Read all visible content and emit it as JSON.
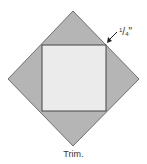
{
  "diagram": {
    "caption": "Trim.",
    "measurement_label": {
      "numerator": "1",
      "denominator": "4",
      "unit_mark": "\""
    },
    "colors": {
      "outer_diamond_fill": "#b5b5b5",
      "outer_diamond_stroke": "#555555",
      "inner_square_fill": "#ebebeb",
      "inner_square_stroke": "#444444",
      "arrow": "#222222",
      "text": "#333333"
    },
    "shapes": {
      "diamond": {
        "top": [
          73,
          11
        ],
        "right": [
          139,
          79
        ],
        "bottom": [
          73,
          146
        ],
        "left": [
          8,
          79
        ]
      },
      "square": {
        "x": 42,
        "y": 45,
        "width": 64,
        "height": 66
      }
    }
  }
}
